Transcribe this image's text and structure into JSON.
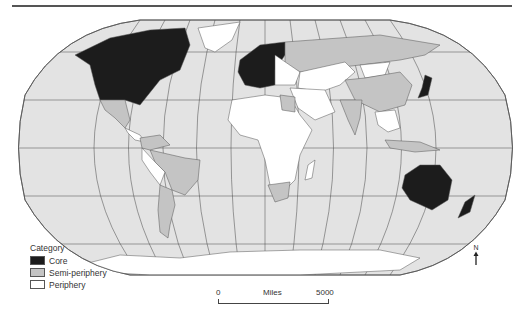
{
  "map": {
    "projection": "Robinson world map",
    "colors": {
      "ocean": "#e3e3e3",
      "core": "#1c1c1c",
      "semi_periphery": "#c4c4c4",
      "periphery": "#ffffff",
      "outline": "#555555"
    }
  },
  "legend": {
    "title": "Category",
    "items": [
      {
        "label": "Core",
        "color": "#1c1c1c"
      },
      {
        "label": "Semi-periphery",
        "color": "#c4c4c4"
      },
      {
        "label": "Periphery",
        "color": "#ffffff"
      }
    ]
  },
  "scale_bar": {
    "start": "0",
    "unit": "Miles",
    "end": "5000"
  },
  "north_arrow": {
    "label": "N"
  }
}
